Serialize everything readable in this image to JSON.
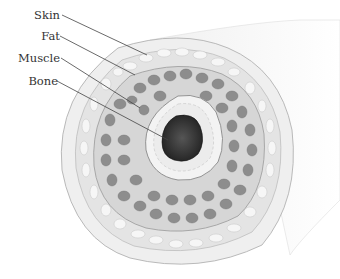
{
  "figure": {
    "labels": [
      {
        "text": "Skin",
        "x": 0,
        "y": 9
      },
      {
        "text": "Fat",
        "x": 0,
        "y": 30
      },
      {
        "text": "Muscle",
        "x": 0,
        "y": 52
      },
      {
        "text": "Bone",
        "x": 0,
        "y": 75
      }
    ],
    "colors": {
      "skin": "#eeeeee",
      "fat": "#e6e6e6",
      "muscle_bundle": "#8a8a8a",
      "muscle_bg": "#d8d8d8",
      "bone_ring": "#f2f2f2",
      "marrow": "#2a2a2a",
      "leader_line": "#444444"
    }
  }
}
